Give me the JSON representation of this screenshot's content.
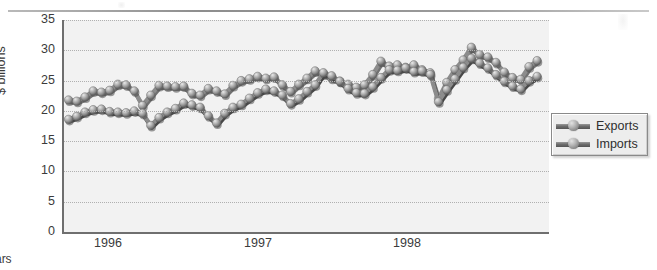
{
  "page": {
    "background_color": "#ffffff",
    "has_top_rule": true
  },
  "chart_data": {
    "type": "line",
    "title": "",
    "subtitle": "",
    "xlabel": "Years",
    "ylabel": "$ billions",
    "ylim": [
      0,
      35
    ],
    "ytick_labels": [
      "35",
      "30",
      "25",
      "20",
      "15",
      "10",
      "5",
      "0"
    ],
    "ytick_values": [
      35,
      30,
      25,
      20,
      15,
      10,
      5,
      0
    ],
    "xtick_labels": [
      "1996",
      "1997",
      "1998"
    ],
    "xtick_positions": [
      108,
      258,
      407
    ],
    "grid": true,
    "grid_style": "dotted-horizontal",
    "legend_position": "right",
    "plot_background": "#f2f2f2",
    "axis_color": "#6f6f6f",
    "marker_style": "3d-sphere",
    "series": [
      {
        "name": "Exports",
        "color": "#8c8c8c",
        "values": [
          21.8,
          21.6,
          22.3,
          23.3,
          23.1,
          23.4,
          24.4,
          24.3,
          23.3,
          20.9,
          22.6,
          24.2,
          24.1,
          24.0,
          24.1,
          22.9,
          22.6,
          23.7,
          23.3,
          22.8,
          24.2,
          25.0,
          25.3,
          25.7,
          25.4,
          25.6,
          24.3,
          23.2,
          24.4,
          25.4,
          26.6,
          26.1,
          25.4,
          24.9,
          24.4,
          23.9,
          24.3,
          26.0,
          28.2,
          27.4,
          27.6,
          27.2,
          27.6,
          26.8,
          26.3,
          22.0,
          24.7,
          26.8,
          28.4,
          30.5,
          29.3,
          28.9,
          28.0,
          26.4,
          25.5,
          25.2,
          27.3,
          28.3
        ]
      },
      {
        "name": "Imports",
        "color": "#8c8c8c",
        "values": [
          18.6,
          19.1,
          19.8,
          20.2,
          20.3,
          19.9,
          19.8,
          19.7,
          20.0,
          19.6,
          17.6,
          18.9,
          19.8,
          20.4,
          21.3,
          21.0,
          20.6,
          19.2,
          18.0,
          19.6,
          20.6,
          21.1,
          22.1,
          23.0,
          23.6,
          23.3,
          22.6,
          21.2,
          22.0,
          23.2,
          24.3,
          26.3,
          25.8,
          24.9,
          23.7,
          23.0,
          22.9,
          24.0,
          25.5,
          26.8,
          26.7,
          27.1,
          26.5,
          26.6,
          26.0,
          21.5,
          23.5,
          25.3,
          27.2,
          28.7,
          27.9,
          27.1,
          26.0,
          24.9,
          24.1,
          23.6,
          25.0,
          25.7
        ]
      }
    ]
  },
  "legend": {
    "items": [
      {
        "label": "Exports",
        "swatch": "sphere-line-marker"
      },
      {
        "label": "Imports",
        "swatch": "sphere-line-marker"
      }
    ]
  }
}
